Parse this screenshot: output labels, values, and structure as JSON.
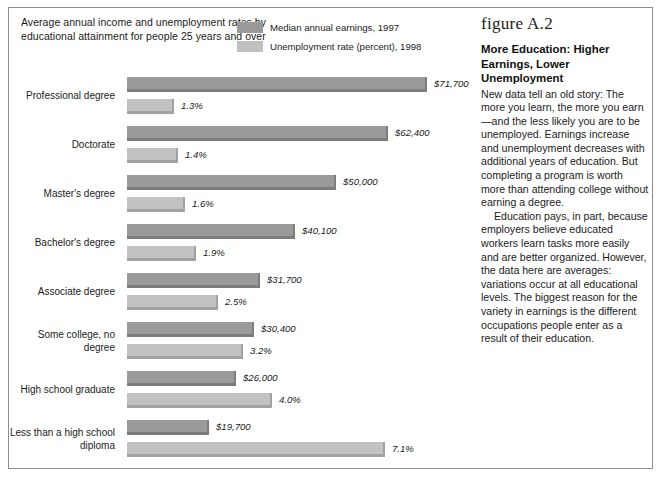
{
  "chart_panel": {
    "title": "Average annual income and unemployment rates by educational attainment for people 25 years and over",
    "legend": [
      {
        "label": "Median annual earnings, 1997",
        "color": "#9a9a9a",
        "key": "earnings"
      },
      {
        "label": "Unemployment rate (percent), 1998",
        "color": "#c0c0c0",
        "key": "unemployment"
      }
    ]
  },
  "sidebar": {
    "figure_number": "figure A.2",
    "title": "More Education: Higher Earnings, Lower Unemployment",
    "paragraphs": [
      "New data tell an old story: The more you learn, the more you earn—and the less likely you are to be unemployed. Earnings increase and unemployment decreases with additional years of education. But completing a program is worth more than attending college without earning a degree.",
      "Education pays, in part, because employers believe educated workers learn tasks more easily and are better organized. However, the data here are averages: variations occur at all educational levels. The biggest reason for the variety in earnings is the different occupations people enter as a result of their education."
    ]
  },
  "chart_data": {
    "type": "bar",
    "orientation": "horizontal",
    "title": "Average annual income and unemployment rates by educational attainment for people 25 years and over",
    "xlabel": "",
    "ylabel": "",
    "grid": false,
    "legend_position": "top-right",
    "categories": [
      "Professional degree",
      "Doctorate",
      "Master's degree",
      "Bachelor's degree",
      "Associate degree",
      "Some college, no degree",
      "High school graduate",
      "Less than a high school diploma"
    ],
    "series": [
      {
        "name": "Median annual earnings, 1997",
        "color": "#9a9a9a",
        "unit": "USD",
        "values": [
          71700,
          62400,
          50000,
          40100,
          31700,
          30400,
          26000,
          19700
        ],
        "labels": [
          "$71,700",
          "$62,400",
          "$50,000",
          "$40,100",
          "$31,700",
          "$30,400",
          "$26,000",
          "$19,700"
        ],
        "max": 71700
      },
      {
        "name": "Unemployment rate (percent), 1998",
        "color": "#c2c2c2",
        "unit": "percent",
        "values": [
          1.3,
          1.4,
          1.6,
          1.9,
          2.5,
          3.2,
          4.0,
          7.1
        ],
        "labels": [
          "1.3%",
          "1.4%",
          "1.6%",
          "1.9%",
          "2.5%",
          "3.2%",
          "4.0%",
          "7.1%"
        ],
        "max": 7.1
      }
    ]
  }
}
